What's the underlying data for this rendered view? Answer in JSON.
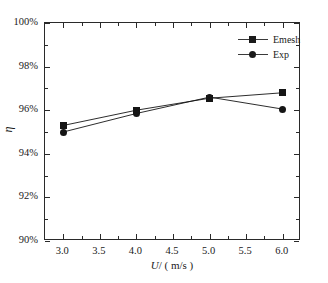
{
  "chart_data": {
    "type": "line",
    "title": "",
    "xlabel": "U/ ( m/s )",
    "ylabel": "η",
    "x": [
      3.0,
      4.0,
      5.0,
      6.0
    ],
    "xlim": [
      2.75,
      6.25
    ],
    "ylim": [
      90,
      100
    ],
    "xticks": [
      "3.0",
      "3.5",
      "4.0",
      "4.5",
      "5.0",
      "5.5",
      "6.0"
    ],
    "xtick_values": [
      3.0,
      3.5,
      4.0,
      4.5,
      5.0,
      5.5,
      6.0
    ],
    "yticks": [
      "90%",
      "92%",
      "94%",
      "96%",
      "98%",
      "100%"
    ],
    "ytick_values": [
      90,
      92,
      94,
      96,
      98,
      100
    ],
    "grid": false,
    "legend_position": "top-right",
    "series": [
      {
        "name": "Emesh",
        "marker": "square",
        "color": "#151515",
        "values": [
          95.3,
          96.0,
          96.55,
          96.8
        ]
      },
      {
        "name": "Exp",
        "marker": "circle",
        "color": "#151515",
        "values": [
          95.0,
          95.85,
          96.6,
          96.05
        ]
      }
    ]
  },
  "axis": {
    "x_title_italic": "U",
    "x_title_rest": "/ ( m/s )",
    "y_title": "η"
  },
  "legend": {
    "items": [
      {
        "label": "Emesh",
        "marker": "square-marker"
      },
      {
        "label": "Exp",
        "marker": "circle-marker"
      }
    ]
  }
}
